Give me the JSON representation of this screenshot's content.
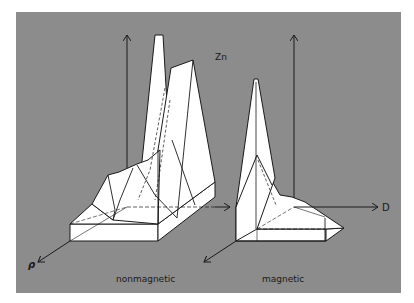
{
  "figure": {
    "element_label": "Zn",
    "axes": {
      "horizontal_label": "D",
      "depth_label": "ρ"
    },
    "plots": [
      {
        "id": "nonmagnetic",
        "caption": "nonmagnetic"
      },
      {
        "id": "magnetic",
        "caption": "magnetic"
      }
    ]
  },
  "colors": {
    "background": "#8c8c8c",
    "surface": "#ffffff",
    "lines": "#1a1a1a"
  }
}
